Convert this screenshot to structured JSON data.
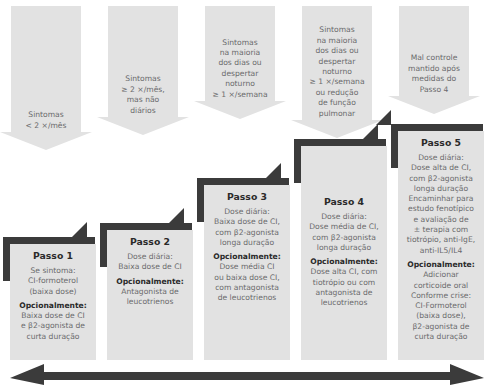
{
  "diagram": {
    "colors": {
      "card_grey": "#e2e2e2",
      "bracket_dark": "#3b3b3b",
      "body_text": "#6a6a6c",
      "title_text": "#2a2a2a",
      "axis_arrow": "#3b3b3b"
    },
    "columns": [
      {
        "id": "passo-1",
        "trigger": [
          "Sintomas",
          "< 2 ×/mês"
        ],
        "step_title": "Passo 1",
        "body": [
          {
            "type": "plain",
            "lines": [
              "Se sintoma:",
              "CI-formoterol",
              "(baixa dose)"
            ]
          },
          {
            "type": "bold",
            "lines": [
              "Opcionalmente:"
            ]
          },
          {
            "type": "plain",
            "lines": [
              "Baixa dose de CI",
              "e β2-agonista de",
              "curta duração"
            ]
          }
        ]
      },
      {
        "id": "passo-2",
        "trigger": [
          "Sintomas",
          "≥ 2 ×/mês,",
          "mas não",
          "diários"
        ],
        "step_title": "Passo 2",
        "body": [
          {
            "type": "plain",
            "lines": [
              "Dose diária:",
              "Baixa dose de CI"
            ]
          },
          {
            "type": "bold",
            "lines": [
              "Opcionalmente:"
            ]
          },
          {
            "type": "plain",
            "lines": [
              "Antagonista de",
              "leucotrienos"
            ]
          }
        ]
      },
      {
        "id": "passo-3",
        "trigger": [
          "Sintomas",
          "na maioria",
          "dos dias ou",
          "despertar",
          "noturno",
          "≥ 1 ×/semana"
        ],
        "step_title": "Passo 3",
        "body": [
          {
            "type": "plain",
            "lines": [
              "Dose diária:",
              "Baixa dose de CI,",
              "com β2-agonista",
              "longa duração"
            ]
          },
          {
            "type": "bold",
            "lines": [
              "Opcionalmente:"
            ]
          },
          {
            "type": "plain",
            "lines": [
              "Dose média CI",
              "ou baixa dose CI,",
              "com antagonista",
              "de leucotrienos"
            ]
          }
        ]
      },
      {
        "id": "passo-4",
        "trigger": [
          "Sintomas",
          "na maioria",
          "dos dias ou",
          "despertar",
          "noturno",
          "≥ 1 ×/semana",
          "ou redução",
          "de função",
          "pulmonar"
        ],
        "step_title": "Passo 4",
        "body": [
          {
            "type": "plain",
            "lines": [
              "Dose diária:",
              "Dose média de CI,",
              "com β2-agonista",
              "longa duração"
            ]
          },
          {
            "type": "bold",
            "lines": [
              "Opcionalmente:"
            ]
          },
          {
            "type": "plain",
            "lines": [
              "Dose alta CI, com",
              "tiotrópio ou com",
              "antagonista de",
              "leucotrienos"
            ]
          }
        ]
      },
      {
        "id": "passo-5",
        "trigger": [
          "Mal controle",
          "mantido após",
          "medidas do",
          "Passo 4"
        ],
        "step_title": "Passo 5",
        "body": [
          {
            "type": "plain",
            "lines": [
              "Dose diária:",
              "Dose alta de CI,",
              "com β2-agonista",
              "longa duração",
              "Encaminhar para",
              "estudo fenotípico",
              "e avaliação de",
              "± terapia com",
              "tiotrópio, anti-IgE,",
              "anti-IL5/IL4"
            ]
          },
          {
            "type": "bold",
            "lines": [
              "Opcionalmente:"
            ]
          },
          {
            "type": "plain",
            "lines": [
              "Adicionar",
              "corticoide oral",
              "Conforme crise:",
              "CI-Formoterol",
              "(baixa dose),",
              "β2-agonista de",
              "curta duração"
            ]
          }
        ]
      }
    ],
    "axis": {
      "name": "escalonamento-bidirecional",
      "left_arrow": "step-down",
      "right_arrow": "step-up"
    }
  }
}
